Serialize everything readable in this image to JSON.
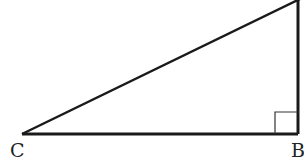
{
  "diagram": {
    "type": "right-triangle",
    "vertices": {
      "C": {
        "label": "C"
      },
      "B": {
        "label": "B"
      },
      "A": {
        "label": ""
      }
    },
    "right_angle_at": "B",
    "stroke_color": "#1a1a1a",
    "label_color": "#222222"
  }
}
